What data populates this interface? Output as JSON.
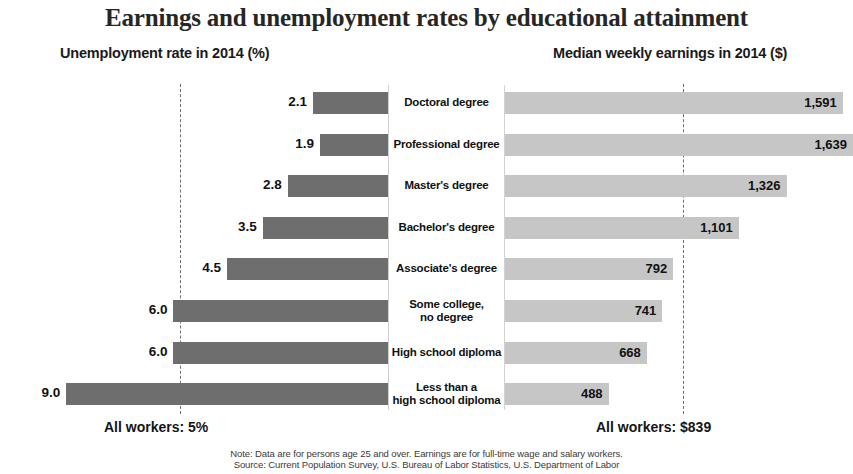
{
  "title": "Earnings and unemployment rates by educational attainment",
  "headers": {
    "left": "Unemployment rate in 2014 (%)",
    "right": "Median weekly earnings in 2014 ($)"
  },
  "footer": {
    "left": "All workers: 5%",
    "right": "All workers: $839",
    "note": "Note: Data are for persons age 25 and over. Earnings are for full-time wage and salary workers.",
    "source": "Source: Current Population Survey, U.S. Bureau of Labor Statistics, U.S. Department of Labor"
  },
  "colors": {
    "unemployment_bar": "#6e6e6e",
    "earnings_bar": "#c6c6c6",
    "reference_line": "#6e6e6e"
  },
  "chart_data": {
    "type": "bar",
    "title": "Earnings and unemployment rates by educational attainment",
    "orientation": "horizontal",
    "layout": "back-to-back pyramid; unemployment rate on left axis (reversed), median weekly earnings on right axis",
    "categories": [
      "Doctoral degree",
      "Professional degree",
      "Master's degree",
      "Bachelor's degree",
      "Associate's degree",
      "Some college, no degree",
      "High school diploma",
      "Less than a high school diploma"
    ],
    "series": [
      {
        "name": "Unemployment rate in 2014 (%)",
        "side": "left",
        "unit": "%",
        "values": [
          2.1,
          1.9,
          2.8,
          3.5,
          4.5,
          6.0,
          6.0,
          9.0
        ],
        "labels": [
          "2.1",
          "1.9",
          "2.8",
          "3.5",
          "4.5",
          "6.0",
          "6.0",
          "9.0"
        ],
        "xlim": [
          0,
          9.9
        ],
        "reference_line": {
          "value": 5,
          "label": "All workers: 5%"
        }
      },
      {
        "name": "Median weekly earnings in 2014 ($)",
        "side": "right",
        "unit": "$",
        "values": [
          1591,
          1639,
          1326,
          1101,
          792,
          741,
          668,
          488
        ],
        "labels": [
          "1,591",
          "1,639",
          "1,326",
          "1,101",
          "792",
          "741",
          "668",
          "488"
        ],
        "xlim": [
          0,
          1639
        ],
        "reference_line": {
          "value": 839,
          "label": "All workers: $839"
        }
      }
    ],
    "xlabel": "",
    "ylabel": "",
    "grid": false,
    "legend": false,
    "annotations": [
      "Note: Data are for persons age 25 and over. Earnings are for full-time wage and salary workers.",
      "Source: Current Population Survey, U.S. Bureau of Labor Statistics, U.S. Department of Labor"
    ]
  },
  "rows": [
    {
      "label_line1": "Doctoral degree",
      "label_line2": "",
      "rate": "2.1",
      "earn": "1,591"
    },
    {
      "label_line1": "Professional degree",
      "label_line2": "",
      "rate": "1.9",
      "earn": "1,639"
    },
    {
      "label_line1": "Master's degree",
      "label_line2": "",
      "rate": "2.8",
      "earn": "1,326"
    },
    {
      "label_line1": "Bachelor's degree",
      "label_line2": "",
      "rate": "3.5",
      "earn": "1,101"
    },
    {
      "label_line1": "Associate's degree",
      "label_line2": "",
      "rate": "4.5",
      "earn": "792"
    },
    {
      "label_line1": "Some college,",
      "label_line2": "no degree",
      "rate": "6.0",
      "earn": "741"
    },
    {
      "label_line1": "High school diploma",
      "label_line2": "",
      "rate": "6.0",
      "earn": "668"
    },
    {
      "label_line1": "Less than a",
      "label_line2": "high school diploma",
      "rate": "9.0",
      "earn": "488"
    }
  ]
}
